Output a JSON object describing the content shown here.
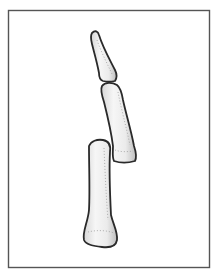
{
  "figure": {
    "subject": "finger bones (phalanges), lateral view, separated",
    "colors": {
      "frame_stroke": "#555555",
      "bone_outline": "#2a2a2a",
      "bone_fill_light": "#f4f4f4",
      "bone_fill_shade": "#c9c9c9",
      "stipple": "#9a9a9a",
      "background": "#ffffff"
    },
    "parts": [
      {
        "name": "distal phalanx"
      },
      {
        "name": "middle phalanx"
      },
      {
        "name": "proximal phalanx"
      }
    ]
  }
}
